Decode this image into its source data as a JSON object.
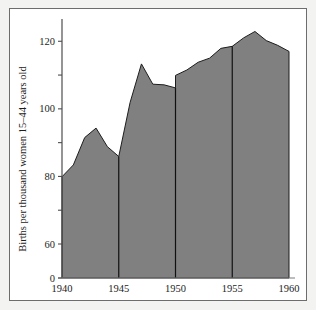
{
  "figure": {
    "background_color": "#f3f3f1",
    "plate_color": "#ffffff",
    "border_color": "#6d6d6d"
  },
  "chart_data": {
    "type": "area",
    "title": "",
    "subtitle": "",
    "xlabel": "",
    "ylabel": "Births per thousand women 15–44 years old",
    "xlim": [
      1940,
      1960
    ],
    "ylim": [
      0,
      126
    ],
    "grid": false,
    "legend": null,
    "fill_color": "#808080",
    "line_color": "#1d1d1d",
    "x_ticks": [
      1940,
      1945,
      1950,
      1955,
      1960
    ],
    "x_tick_labels": [
      "1940",
      "1945",
      "1950",
      "1955",
      "1960"
    ],
    "y_ticks": [
      0,
      60,
      70,
      80,
      90,
      100,
      110,
      120
    ],
    "y_tick_labels": [
      "0",
      "60",
      "",
      "80",
      "",
      "100",
      "",
      "120"
    ],
    "y_axis_note": "broken axis: compressed between 0 and 60",
    "divider_years": [
      1945,
      1950,
      1955
    ],
    "x": [
      1940,
      1941,
      1942,
      1943,
      1944,
      1945,
      1945,
      1946,
      1947,
      1948,
      1949,
      1950,
      1950,
      1951,
      1952,
      1953,
      1954,
      1955,
      1956,
      1957,
      1958,
      1959,
      1960
    ],
    "values": [
      79.9,
      83.4,
      91.5,
      94.3,
      88.8,
      85.9,
      85.9,
      101.9,
      113.3,
      107.3,
      107.1,
      106.2,
      109.9,
      111.5,
      113.8,
      115.0,
      117.9,
      118.5,
      121.0,
      122.9,
      120.2,
      118.8,
      117.0
    ],
    "series": [
      {
        "name": "Births per thousand women 15–44 years old",
        "values": [
          79.9,
          83.4,
          91.5,
          94.3,
          88.8,
          85.9,
          85.9,
          101.9,
          113.3,
          107.3,
          107.1,
          106.2,
          109.9,
          111.5,
          113.8,
          115.0,
          117.9,
          118.5,
          121.0,
          122.9,
          120.2,
          118.8,
          117.0
        ]
      }
    ],
    "annotations": []
  }
}
